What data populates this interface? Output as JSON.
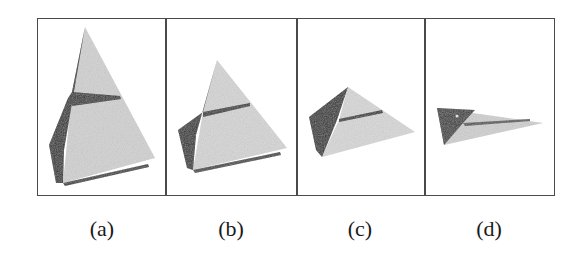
{
  "figure": {
    "panels": [
      {
        "id": "a",
        "label": "(a)",
        "description": "tall pyramid, side view"
      },
      {
        "id": "b",
        "label": "(b)",
        "description": "medium pyramid"
      },
      {
        "id": "c",
        "label": "(c)",
        "description": "flattened pyramid"
      },
      {
        "id": "d",
        "label": "(d)",
        "description": "nearly flat triangle"
      }
    ],
    "colors": {
      "frame": "#4a4a4a",
      "light_face": "#d4d4d4",
      "dark_face": "#2e2e2e",
      "stripe": "#333333"
    }
  }
}
